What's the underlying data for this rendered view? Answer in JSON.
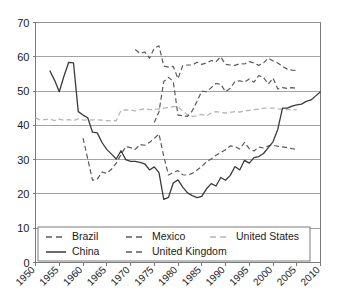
{
  "chart_data": {
    "type": "line",
    "title": "",
    "subtitle": "",
    "xlabel": "",
    "ylabel": "",
    "xlim": [
      1950,
      2010
    ],
    "ylim": [
      0,
      70
    ],
    "ytick_values": [
      0,
      10,
      20,
      30,
      40,
      50,
      60,
      70
    ],
    "ytick_labels": [
      "0",
      "10",
      "20",
      "30",
      "40",
      "50",
      "60",
      "70"
    ],
    "xtick_values": [
      1950,
      1955,
      1960,
      1965,
      1970,
      1975,
      1980,
      1985,
      1990,
      1995,
      2000,
      2005,
      2010
    ],
    "xtick_labels": [
      "1950",
      "1955",
      "1960",
      "1965",
      "1970",
      "1975",
      "1980",
      "1985",
      "1990",
      "1995",
      "2000",
      "2005",
      "2010"
    ],
    "grid": "horizontal",
    "legend_position": "bottom-inside",
    "series": [
      {
        "name": "Brazil",
        "style": "dashed",
        "color": "#5a5a5a",
        "dash": "5,3",
        "width": 1.2,
        "x": [
          1971,
          1972,
          1973,
          1974,
          1975,
          1976,
          1977,
          1978,
          1979,
          1980,
          1981,
          1982,
          1983,
          1984,
          1985,
          1986,
          1987,
          1988,
          1989,
          1990,
          1991,
          1992,
          1993,
          1994,
          1995,
          1996,
          1997,
          1998,
          1999,
          2000,
          2001,
          2002,
          2003,
          2004,
          2005
        ],
        "values": [
          62.1,
          61.0,
          61.4,
          59.6,
          62.5,
          63.2,
          57.3,
          57.0,
          57.2,
          53.6,
          57.4,
          57.6,
          57.6,
          58.4,
          57.8,
          58.2,
          58.9,
          58.6,
          60.0,
          57.8,
          57.6,
          57.5,
          58.0,
          57.9,
          58.6,
          58.2,
          57.5,
          58.2,
          59.6,
          58.8,
          58.2,
          57.2,
          56.4,
          56.1,
          56.0
        ]
      },
      {
        "name": "China",
        "style": "solid",
        "color": "#3a3a3a",
        "dash": "",
        "width": 1.3,
        "x": [
          1953,
          1954,
          1955,
          1956,
          1957,
          1958,
          1959,
          1960,
          1961,
          1962,
          1963,
          1964,
          1965,
          1966,
          1967,
          1968,
          1969,
          1970,
          1971,
          1972,
          1973,
          1974,
          1975,
          1976,
          1977,
          1978,
          1979,
          1980,
          1981,
          1982,
          1983,
          1984,
          1985,
          1986,
          1987,
          1988,
          1989,
          1990,
          1991,
          1992,
          1993,
          1994,
          1995,
          1996,
          1997,
          1998,
          1999,
          2000,
          2001,
          2002,
          2003,
          2004,
          2005,
          2006,
          2007,
          2008,
          2009,
          2010
        ],
        "values": [
          56.0,
          53.2,
          49.8,
          54.4,
          58.4,
          58.2,
          44.0,
          43.0,
          42.2,
          38.0,
          37.8,
          35.0,
          33.0,
          31.6,
          30.2,
          32.6,
          30.0,
          29.5,
          29.5,
          29.2,
          28.8,
          27.0,
          27.9,
          26.2,
          18.4,
          19.0,
          23.2,
          24.1,
          22.0,
          20.3,
          19.5,
          18.9,
          19.3,
          21.5,
          23.0,
          22.3,
          24.8,
          24.0,
          25.4,
          28.0,
          27.0,
          29.8,
          29.0,
          30.6,
          30.9,
          31.8,
          33.5,
          35.2,
          38.8,
          45.0,
          45.0,
          45.6,
          46.0,
          46.2,
          47.0,
          47.4,
          48.6,
          49.8
        ]
      },
      {
        "name": "Mexico",
        "style": "dashed",
        "color": "#5a5a5a",
        "dash": "5,3",
        "width": 1.2,
        "x": [
          1960,
          1961,
          1962,
          1963,
          1964,
          1965,
          1966,
          1967,
          1968,
          1969,
          1970,
          1971,
          1972,
          1973,
          1974,
          1975,
          1976,
          1977,
          1978,
          1979,
          1980,
          1981,
          1982,
          1983,
          1984,
          1985,
          1986,
          1987,
          1988,
          1989,
          1990,
          1991,
          1992,
          1993,
          1994,
          1995,
          1996,
          1997,
          1998,
          1999,
          2000,
          2001,
          2002,
          2003,
          2004,
          2005
        ],
        "values": [
          36.3,
          30.2,
          24.0,
          24.3,
          26.4,
          26.0,
          27.2,
          29.0,
          31.5,
          33.8,
          33.5,
          33.0,
          34.4,
          34.2,
          35.0,
          36.2,
          37.5,
          31.0,
          25.5,
          26.3,
          26.8,
          25.6,
          25.5,
          26.0,
          27.0,
          28.0,
          29.4,
          30.2,
          31.3,
          32.0,
          32.9,
          34.0,
          33.8,
          33.1,
          35.0,
          33.2,
          32.5,
          33.7,
          33.4,
          34.0,
          34.2,
          33.9,
          33.7,
          33.5,
          33.2,
          33.0
        ]
      },
      {
        "name": "United Kingdom",
        "style": "dashed",
        "color": "#5a5a5a",
        "dash": "5,3",
        "width": 1.2,
        "x": [
          1975,
          1976,
          1977,
          1978,
          1979,
          1980,
          1981,
          1982,
          1983,
          1984,
          1985,
          1986,
          1987,
          1988,
          1989,
          1990,
          1991,
          1992,
          1993,
          1994,
          1995,
          1996,
          1997,
          1998,
          1999,
          2000,
          2001,
          2002,
          2003,
          2004,
          2005
        ],
        "values": [
          40.8,
          44.0,
          52.8,
          54.0,
          52.8,
          43.0,
          42.8,
          42.6,
          44.2,
          47.0,
          50.0,
          49.8,
          51.0,
          52.2,
          52.0,
          49.8,
          50.8,
          52.8,
          53.0,
          52.6,
          53.5,
          52.6,
          54.5,
          54.0,
          52.0,
          53.8,
          50.6,
          51.0,
          50.8,
          51.0,
          50.8
        ]
      },
      {
        "name": "United States",
        "style": "dashed",
        "color": "#b5b5b5",
        "dash": "5,3",
        "width": 1.3,
        "x": [
          1950,
          1951,
          1952,
          1953,
          1954,
          1955,
          1956,
          1957,
          1958,
          1959,
          1960,
          1961,
          1962,
          1963,
          1964,
          1965,
          1966,
          1967,
          1968,
          1969,
          1970,
          1971,
          1972,
          1973,
          1974,
          1975,
          1976,
          1977,
          1978,
          1979,
          1980,
          1981,
          1982,
          1983,
          1984,
          1985,
          1986,
          1987,
          1988,
          1989,
          1990,
          1991,
          1992,
          1993,
          1994,
          1995,
          1996,
          1997,
          1998,
          1999,
          2000,
          2001,
          2002,
          2003,
          2004,
          2005
        ],
        "values": [
          42.2,
          41.6,
          41.7,
          41.9,
          41.4,
          41.8,
          41.5,
          41.7,
          41.4,
          41.9,
          41.6,
          41.5,
          41.6,
          41.6,
          41.5,
          41.4,
          41.3,
          41.4,
          44.3,
          44.5,
          44.4,
          44.2,
          44.6,
          44.8,
          44.6,
          44.6,
          44.8,
          45.0,
          45.2,
          45.5,
          45.4,
          44.2,
          43.0,
          42.6,
          42.8,
          43.2,
          42.8,
          43.6,
          44.0,
          43.8,
          43.6,
          43.8,
          44.0,
          43.9,
          44.2,
          44.4,
          44.6,
          44.7,
          45.0,
          45.0,
          45.0,
          44.8,
          44.7,
          44.6,
          44.6,
          44.5
        ]
      }
    ]
  },
  "legend": {
    "entries": [
      {
        "label": "Brazil",
        "series": "Brazil"
      },
      {
        "label": "Mexico",
        "series": "Mexico"
      },
      {
        "label": "United States",
        "series": "United States"
      },
      {
        "label": "China",
        "series": "China"
      },
      {
        "label": "United Kingdom",
        "series": "United Kingdom"
      }
    ]
  },
  "colors": {
    "dark_line": "#3a3a3a",
    "dashed_line": "#5a5a5a",
    "light_line": "#b5b5b5",
    "gridline": "#8c8c8c",
    "axis": "#7a7a7a",
    "text": "#1a1a1a",
    "background": "#ffffff"
  }
}
